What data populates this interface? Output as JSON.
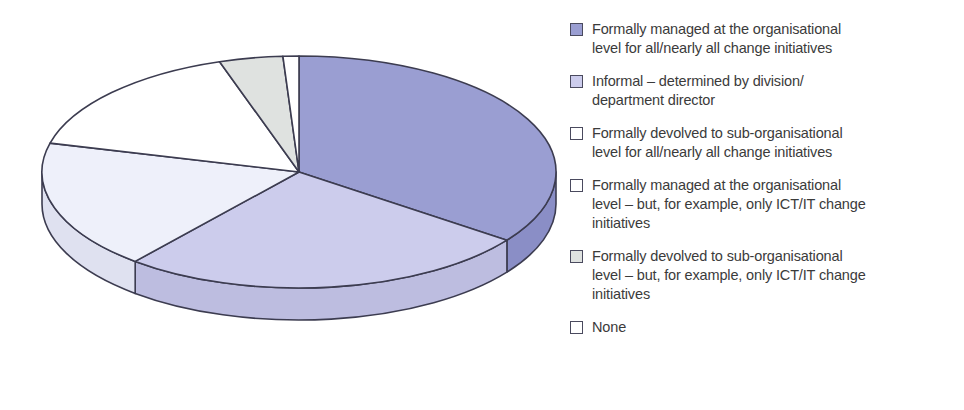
{
  "chart_data": {
    "type": "pie",
    "title": "",
    "subtitle": "",
    "xlabel": "",
    "ylabel": "",
    "three_d": true,
    "legend_position": "right",
    "grid": false,
    "categories": [
      "Formally managed at the organisational level for all/nearly all change initiatives",
      "Informal – determined by division/department director",
      "Formally devolved to sub-organisational level for all/nearly all change initiatives",
      "Formally managed at the organisational level – but, for example, only ICT/IT change initiatives",
      "Formally devolved to sub-organisational level – but, for example, only ICT/IT change initiatives",
      "None"
    ],
    "values": [
      35,
      26,
      18,
      16,
      4,
      1
    ],
    "colors": [
      "#9a9ed2",
      "#ccccec",
      "#eef0fa",
      "#ffffff",
      "#dfe2e0",
      "#ffffff"
    ],
    "start_angle_deg": 0,
    "direction": "clockwise"
  },
  "pie": {
    "slices": [
      {
        "name": "formally-managed-organisational-all",
        "value": 35,
        "color": "#9a9ed2",
        "side_color": "#8a8ec6",
        "start_deg": 0,
        "end_deg": 126
      },
      {
        "name": "informal-division-department-director",
        "value": 26,
        "color": "#ccccec",
        "side_color": "#bdbde0",
        "start_deg": 126,
        "end_deg": 219.6
      },
      {
        "name": "formally-devolved-sub-organisational-all",
        "value": 18,
        "color": "#eef0fa",
        "side_color": "#dfe1f0",
        "start_deg": 219.6,
        "end_deg": 284.4
      },
      {
        "name": "formally-managed-organisational-ict-it",
        "value": 16,
        "color": "#ffffff",
        "side_color": "#f2f2f2",
        "start_deg": 284.4,
        "end_deg": 342
      },
      {
        "name": "formally-devolved-sub-organisational-ict-it",
        "value": 4,
        "color": "#dfe2e0",
        "side_color": "#d0d3d1",
        "start_deg": 342,
        "end_deg": 356.4
      },
      {
        "name": "none",
        "value": 1,
        "color": "#ffffff",
        "side_color": "#f2f2f2",
        "start_deg": 356.4,
        "end_deg": 360
      }
    ],
    "geometry": {
      "cx": 299,
      "cy": 172,
      "rx": 257,
      "ry": 116,
      "depth": 32
    },
    "stroke": "#3c3c50",
    "stroke_width": 1.6
  },
  "legend": {
    "items": [
      {
        "name": "legend-item-formally-managed-organisational-all",
        "color": "#9a9ed2",
        "label": "Formally managed at the organisational\nlevel for all/nearly all change initiatives"
      },
      {
        "name": "legend-item-informal-division-department-director",
        "color": "#ccccec",
        "label": "Informal – determined by division/\ndepartment director"
      },
      {
        "name": "legend-item-formally-devolved-sub-organisational-all",
        "color": "#ffffff",
        "label": "Formally devolved to sub-organisational\nlevel for all/nearly all change initiatives"
      },
      {
        "name": "legend-item-formally-managed-organisational-ict-it",
        "color": "#ffffff",
        "label": "Formally managed at the organisational\nlevel – but, for example, only ICT/IT change\ninitiatives"
      },
      {
        "name": "legend-item-formally-devolved-sub-organisational-ict-it",
        "color": "#dfe2e0",
        "label": "Formally devolved to sub-organisational\nlevel – but, for example, only ICT/IT change\ninitiatives"
      },
      {
        "name": "legend-item-none",
        "color": "#ffffff",
        "label": "None"
      }
    ]
  }
}
